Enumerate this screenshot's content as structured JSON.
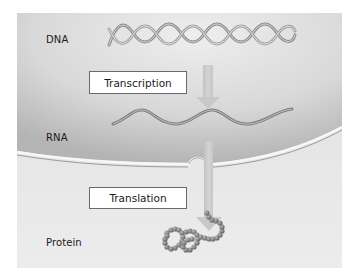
{
  "diagram": {
    "type": "central-dogma-flow",
    "stages": [
      {
        "label": "DNA",
        "graphic": "double-helix"
      },
      {
        "label": "RNA",
        "graphic": "single-strand-wave"
      },
      {
        "label": "Protein",
        "graphic": "bead-chain-polypeptide"
      }
    ],
    "processes": [
      {
        "label": "Transcription",
        "from": "DNA",
        "to": "RNA"
      },
      {
        "label": "Translation",
        "from": "RNA",
        "to": "Protein"
      }
    ],
    "regions": {
      "upper": "nucleus",
      "lower": "cytoplasm",
      "boundary": "nuclear-envelope-with-pore"
    },
    "colors": {
      "panel_light": "#e6e6e6",
      "nucleus_dark": "#bdbdbd",
      "arrow": "#c9c9c9",
      "strand": "#8a8a8a",
      "bead": "#7c7c7c",
      "box_border": "#6a6a6a"
    }
  }
}
